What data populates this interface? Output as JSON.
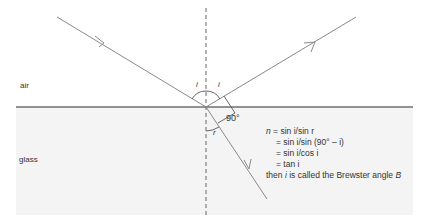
{
  "diagram": {
    "type": "Brewster angle reflection/refraction diagram",
    "colors": {
      "ray": "#8a8a8a",
      "interface": "#6f6f6f",
      "normal": "#555555",
      "glass_fill": "#f4f4f4",
      "text": "#333333"
    },
    "media": {
      "upper": "air",
      "lower": "glass"
    },
    "angle_labels": {
      "incidence": "i",
      "reflection": "i",
      "refraction": "r",
      "right_angle": "90°"
    },
    "equations": {
      "line1_lhs": "n",
      "line1_rhs": " = sin i/sin r",
      "line2": "= sin i/sin (90° – i)",
      "line3": "= sin i/cos i",
      "line4": "= tan i",
      "line5_pre": "then ",
      "line5_var": "i",
      "line5_mid": " is called the Brewster angle ",
      "line5_sym": "B"
    }
  }
}
